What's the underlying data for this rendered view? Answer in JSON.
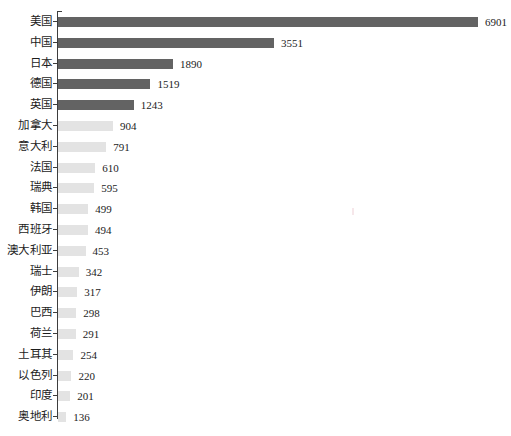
{
  "chart_data": {
    "type": "bar",
    "orientation": "horizontal",
    "title": "",
    "subtitle": "",
    "xlabel": "",
    "ylabel": "",
    "grid": false,
    "legend": null,
    "axis": {
      "value_axis_visible": false,
      "category_axis_visible": true,
      "xlim": [
        0,
        6901
      ]
    },
    "highlight": {
      "dark_color": "#636363",
      "light_color": "#e3e3e3",
      "dark_count": 5
    },
    "categories": [
      "美国",
      "中国",
      "日本",
      "德国",
      "英国",
      "加拿大",
      "意大利",
      "法国",
      "瑞典",
      "韩国",
      "西班牙",
      "澳大利亚",
      "瑞士",
      "伊朗",
      "巴西",
      "荷兰",
      "土耳其",
      "以色列",
      "印度",
      "奥地利"
    ],
    "values": [
      6901,
      3551,
      1890,
      1519,
      1243,
      904,
      791,
      610,
      595,
      499,
      494,
      453,
      342,
      317,
      298,
      291,
      254,
      220,
      201,
      136
    ],
    "data_labels": [
      "6901",
      "3551",
      "1890",
      "1519",
      "1243",
      "904",
      "791",
      "610",
      "595",
      "499",
      "494",
      "453",
      "342",
      "317",
      "298",
      "291",
      "254",
      "220",
      "201",
      "136"
    ]
  }
}
